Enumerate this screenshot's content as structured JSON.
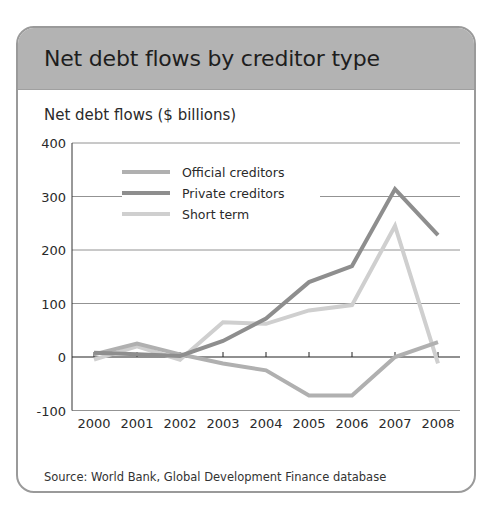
{
  "card": {
    "title": "Net debt flows by creditor type",
    "subtitle": "Net debt flows ($ billions)",
    "source": "Source: World Bank, Global Development Finance database"
  },
  "colors": {
    "header_bg": "#b3b3b3",
    "border": "#9a9a9a",
    "official": "#b0b0b0",
    "private": "#8e8e8e",
    "short_term": "#cfcfcf",
    "grid": "#555555"
  },
  "chart_data": {
    "type": "line",
    "title": "Net debt flows by creditor type",
    "subtitle": "Net debt flows ($ billions)",
    "xlabel": "",
    "ylabel": "Net debt flows ($ billions)",
    "x": [
      "2000",
      "2001",
      "2002",
      "2003",
      "2004",
      "2005",
      "2006",
      "2007",
      "2008"
    ],
    "ylim": [
      -100,
      400
    ],
    "yticks": [
      -100,
      0,
      100,
      200,
      300,
      400
    ],
    "grid": true,
    "legend_position": "upper left",
    "series": [
      {
        "name": "Official creditors",
        "values": [
          5,
          25,
          5,
          -12,
          -25,
          -72,
          -72,
          0,
          28
        ]
      },
      {
        "name": "Private creditors",
        "values": [
          8,
          5,
          2,
          30,
          72,
          140,
          170,
          314,
          228
        ]
      },
      {
        "name": "Short term",
        "values": [
          -5,
          20,
          -5,
          65,
          62,
          87,
          97,
          245,
          -12
        ]
      }
    ],
    "source": "Source: World Bank, Global Development Finance database"
  }
}
